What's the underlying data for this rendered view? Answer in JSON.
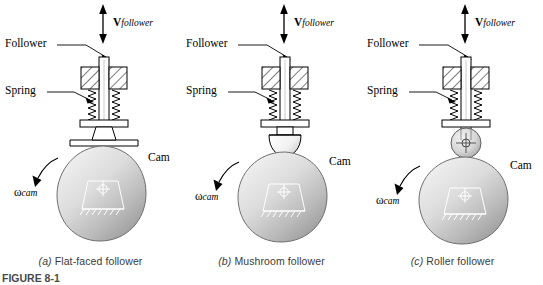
{
  "figure": {
    "caption_partial": "FIGURE 8-1",
    "background_color": "#ffffff",
    "line_color": "#000000",
    "cam_fill_light": "#e6e6e6",
    "cam_fill_dark": "#9a9a9a"
  },
  "panels": [
    {
      "id": "a",
      "caption_index": "(a)",
      "caption_text": "Flat-faced follower",
      "labels": {
        "follower": "Follower",
        "spring": "Spring",
        "cam": "Cam",
        "velocity_symbol": "V",
        "velocity_subscript": "follower",
        "omega_symbol": "ω",
        "omega_subscript": "cam"
      },
      "follower_type": "flat-faced"
    },
    {
      "id": "b",
      "caption_index": "(b)",
      "caption_text": "Mushroom follower",
      "labels": {
        "follower": "Follower",
        "spring": "Spring",
        "cam": "Cam",
        "velocity_symbol": "V",
        "velocity_subscript": "follower",
        "omega_symbol": "ω",
        "omega_subscript": "cam"
      },
      "follower_type": "mushroom"
    },
    {
      "id": "c",
      "caption_index": "(c)",
      "caption_text": "Roller follower",
      "labels": {
        "follower": "Follower",
        "spring": "Spring",
        "cam": "Cam",
        "velocity_symbol": "V",
        "velocity_subscript": "follower",
        "omega_symbol": "ω",
        "omega_subscript": "cam"
      },
      "follower_type": "roller"
    }
  ]
}
